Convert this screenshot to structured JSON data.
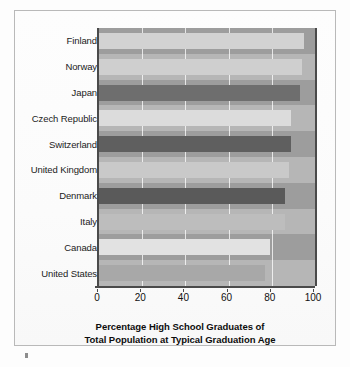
{
  "chart_data": {
    "type": "bar",
    "orientation": "horizontal",
    "title": "",
    "xlabel": "Percentage High School Graduates of Total Population at Typical Graduation Age",
    "xlabel_line1": "Percentage High School Graduates of",
    "xlabel_line2": "Total Population at Typical Graduation Age",
    "ylabel": "",
    "categories": [
      "Finland",
      "Norway",
      "Japan",
      "Czech Republic",
      "Switzerland",
      "United Kingdom",
      "Denmark",
      "Italy",
      "Canada",
      "United States"
    ],
    "values": [
      95,
      94,
      93,
      89,
      89,
      88,
      86,
      86,
      79,
      77
    ],
    "xlim": [
      0,
      100
    ],
    "xticks": [
      0,
      20,
      40,
      60,
      80,
      100
    ],
    "xtick_labels": [
      "0",
      "20",
      "40",
      "60",
      "80",
      "100"
    ],
    "grid": true,
    "legend": false,
    "bar_colors": [
      "#d2d2d2",
      "#cfcfcf",
      "#6e6e6e",
      "#dcdcdc",
      "#5f5f5f",
      "#c9c9c9",
      "#5a5a5a",
      "#bdbdbd",
      "#e2e2e2",
      "#a8a8a8"
    ],
    "plot_background": "#b0b0b0",
    "band_colors": [
      "#9d9d9d",
      "#b6b6b6"
    ],
    "axis_color": "#4a4a4a",
    "frame_color": "#b9b9b9",
    "page_background": "#fdfdfd"
  }
}
